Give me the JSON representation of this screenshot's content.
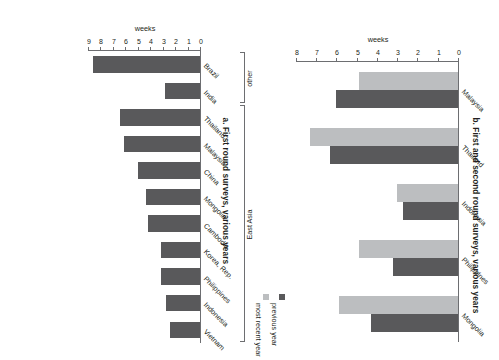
{
  "panel_a": {
    "title": "a. First round surveys, various years",
    "axis_title": "weeks",
    "groups": [
      {
        "label": "East Asia"
      },
      {
        "label": "other"
      }
    ]
  },
  "panel_b": {
    "title": "b. First and second round surveys, various years",
    "axis_title": "weeks",
    "legend": [
      {
        "label": "previous year",
        "color": "#59595b"
      },
      {
        "label": "most recent year",
        "color": "#bcbec0"
      }
    ]
  },
  "chart_data": [
    {
      "type": "bar",
      "title": "a. First round surveys, various years",
      "orientation": "horizontal",
      "xlabel": "",
      "ylabel": "weeks",
      "ylim": [
        0,
        9
      ],
      "yticks": [
        0,
        1,
        2,
        3,
        4,
        5,
        6,
        7,
        8,
        9
      ],
      "grid": false,
      "legend": "none",
      "bar_color": "#59595b",
      "categories": [
        "Vietnam",
        "Indonesia",
        "Philippines",
        "Korea, Rep.",
        "Cambodia",
        "Mongolia",
        "China",
        "Malaysia",
        "Thailand",
        "India",
        "Brazil"
      ],
      "values": [
        2.4,
        2.7,
        3.1,
        3.1,
        4.2,
        4.3,
        5.0,
        6.1,
        6.4,
        2.8,
        8.6
      ],
      "groups": [
        {
          "label": "East Asia",
          "categories": [
            "Vietnam",
            "Indonesia",
            "Philippines",
            "Korea, Rep.",
            "Cambodia",
            "Mongolia",
            "China",
            "Malaysia",
            "Thailand"
          ]
        },
        {
          "label": "other",
          "categories": [
            "India",
            "Brazil"
          ]
        }
      ]
    },
    {
      "type": "bar",
      "title": "b. First and second round surveys, various years",
      "orientation": "horizontal",
      "xlabel": "",
      "ylabel": "weeks",
      "ylim": [
        0,
        8
      ],
      "yticks": [
        0,
        1,
        2,
        3,
        4,
        5,
        6,
        7,
        8
      ],
      "grid": false,
      "legend_position": "right",
      "categories": [
        "Mongolia",
        "Philippines",
        "Indonesia",
        "Thailand",
        "Malaysia"
      ],
      "series": [
        {
          "name": "previous year",
          "color": "#59595b",
          "values": [
            4.3,
            3.2,
            2.7,
            6.3,
            6.0
          ]
        },
        {
          "name": "most recent year",
          "color": "#bcbec0",
          "values": [
            5.9,
            4.9,
            3.0,
            7.3,
            4.9
          ]
        }
      ]
    }
  ]
}
